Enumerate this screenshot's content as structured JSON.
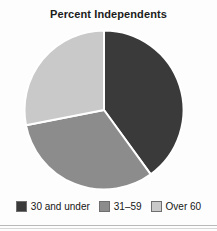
{
  "chart_data": {
    "type": "pie",
    "title": "Percent Independents",
    "xlabel": "",
    "ylabel": "",
    "legend_position": "bottom",
    "grid": false,
    "categories": [
      "30 and under",
      "31–59",
      "Over 60"
    ],
    "values": [
      40,
      32,
      28
    ],
    "start_angle_deg": 0,
    "direction": "clockwise",
    "slices": [
      {
        "label": "30 and under",
        "value": 40,
        "color": "#3a3a3a",
        "start_angle_deg": 0,
        "end_angle_deg": 144
      },
      {
        "label": "31–59",
        "value": 32,
        "color": "#8c8c8c",
        "start_angle_deg": 144,
        "end_angle_deg": 259
      },
      {
        "label": "Over 60",
        "value": 28,
        "color": "#c9c9c9",
        "start_angle_deg": 259,
        "end_angle_deg": 360
      }
    ]
  },
  "legend": {
    "items": [
      {
        "label": "30 and under",
        "color": "#3a3a3a"
      },
      {
        "label": "31–59",
        "color": "#8c8c8c"
      },
      {
        "label": "Over 60",
        "color": "#c9c9c9"
      }
    ]
  },
  "colors": {
    "slice_dark": "#3a3a3a",
    "slice_medium": "#8c8c8c",
    "slice_light": "#c9c9c9",
    "separator": "#ffffff",
    "title_text": "#1b1b1b",
    "legend_text": "#161616",
    "background": "#fdfdfd"
  }
}
